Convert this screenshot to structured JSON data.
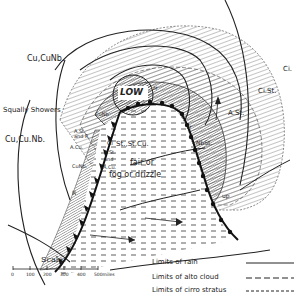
{
  "diagram": {
    "type": "weather-depression-cloud-distribution",
    "center_label": "LOW",
    "labels": {
      "cu_cunb_top": "Cu,CuNb.",
      "squally_showers": "Squally Showers",
      "cu_cunb_left": "Cu,Cu.Nb.",
      "cunb_small": "CuNb",
      "ast_and_r": "A.St. and R",
      "acu_left": "A.Cu.",
      "ci": "Ci",
      "st_stcu": "St.,St.Cu.",
      "ast_small": "A.St.",
      "and_label": "and",
      "acu_center": "A.Cu.",
      "fair_or": "fair or",
      "fog_or_drizzle": "fog or drizzle",
      "cunb_lower": "CuNb.",
      "r_label": "R",
      "rr_top": "rr",
      "rr_right": "rr",
      "nbst": "NbSt.",
      "ast_right": "A.St.",
      "cist": "Ci.St.",
      "ci_far": "Ci.",
      "up": "up"
    }
  },
  "scale": {
    "title": "Scale",
    "ticks": [
      "0",
      "100",
      "200",
      "300",
      "400",
      "500miles"
    ]
  },
  "legend": [
    {
      "label": "Limits of rain",
      "style": "solid"
    },
    {
      "label": "Limits of alto cloud",
      "style": "dashed"
    },
    {
      "label": "Limits of cirro stratus",
      "style": "dotted-dash"
    }
  ]
}
